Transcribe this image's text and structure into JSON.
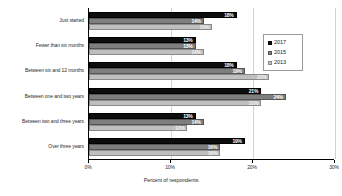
{
  "chart_data": {
    "type": "bar",
    "orientation": "horizontal",
    "title": "",
    "xlabel": "Percent of respondents",
    "ylabel": "",
    "xlim": [
      0,
      30
    ],
    "xticks": [
      "0%",
      "10%",
      "20%",
      "30%"
    ],
    "xtick_values": [
      0,
      10,
      20,
      30
    ],
    "grid": true,
    "grid_axis": "x",
    "legend_position": "right",
    "categories": [
      "Just started",
      "Fewer than six months",
      "Between six and 12 months",
      "Between one and two years",
      "Between two and three years",
      "Over three years"
    ],
    "series": [
      {
        "name": "2017",
        "color": "#0d0d0d",
        "values": [
          18,
          13,
          18,
          21,
          13,
          19
        ],
        "labels": [
          "18%",
          "13%",
          "18%",
          "21%",
          "13%",
          "19%"
        ]
      },
      {
        "name": "2015",
        "color": "#7f7f7f",
        "values": [
          14,
          13,
          19,
          24,
          14,
          16
        ],
        "labels": [
          "14%",
          "13%",
          "19%",
          "24%",
          "14%",
          "16%"
        ]
      },
      {
        "name": "2013",
        "color": "#bfbfbf",
        "values": [
          15,
          14,
          22,
          21,
          12,
          16
        ],
        "labels": [
          "15%",
          "14%",
          "22%",
          "21%",
          "12%",
          "16%"
        ]
      }
    ]
  },
  "legend": {
    "items": [
      {
        "label": "2017"
      },
      {
        "label": "2015"
      },
      {
        "label": "2013"
      }
    ]
  },
  "axis": {
    "x_title": "Percent of respondents",
    "ticks": [
      {
        "label": "0%"
      },
      {
        "label": "10%"
      },
      {
        "label": "20%"
      },
      {
        "label": "30%"
      }
    ]
  }
}
